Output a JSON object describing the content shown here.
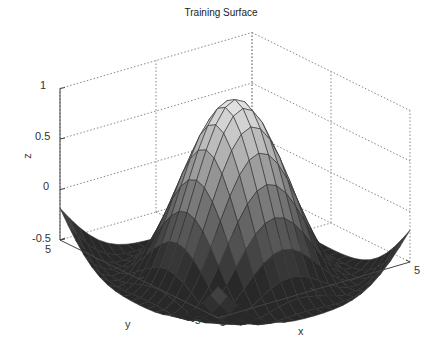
{
  "chart_data": {
    "type": "surface",
    "title": "Training Surface",
    "xlabel": "x",
    "ylabel": "y",
    "zlabel": "z",
    "xlim": [
      -5,
      5
    ],
    "ylim": [
      -5,
      5
    ],
    "zlim": [
      -0.5,
      1
    ],
    "x_ticks": [
      "-5",
      "0",
      "5"
    ],
    "y_ticks": [
      "-5",
      "0",
      "5"
    ],
    "z_ticks": [
      "-0.5",
      "0",
      "0.5",
      "1"
    ],
    "grid": true,
    "colormap": "gray",
    "mesh_resolution": 21,
    "surface_description": "Sombrero-like surface: peak z=1 at (0,0), dipping to about -0.45 around radius ~4.5, rising toward ~0.1 at the corners",
    "peak": {
      "x": 0,
      "y": 0,
      "z": 1
    },
    "corner_values": {
      "x=-5,y=5": 0.1,
      "x=5,y=-5": 0.1
    }
  }
}
